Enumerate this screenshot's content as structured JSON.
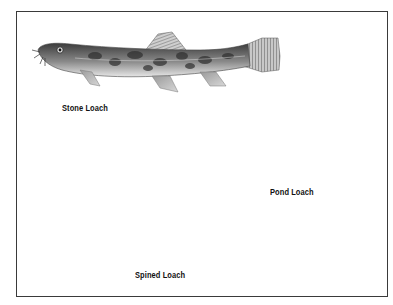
{
  "figure": {
    "type": "illustration",
    "border_color": "#3a3a3a",
    "background": "#ffffff"
  },
  "fish": [
    {
      "name": "Stone Loach",
      "label": "Stone Loach",
      "pattern": "mottled blotches"
    },
    {
      "name": "Pond Loach",
      "label": "Pond Loach",
      "pattern": "longitudinal stripes"
    },
    {
      "name": "Spined Loach",
      "label": "Spined Loach",
      "pattern": "row of dark spots"
    }
  ]
}
